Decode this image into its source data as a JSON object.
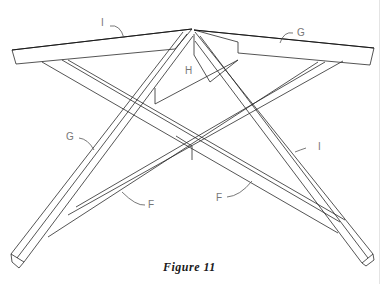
{
  "figure": {
    "caption": "Figure 11",
    "labels": [
      {
        "id": "I-top-left",
        "text": "I",
        "x": 101,
        "y": 26
      },
      {
        "id": "G-top-right",
        "text": "G",
        "x": 297,
        "y": 36
      },
      {
        "id": "H-center",
        "text": "H",
        "x": 185,
        "y": 74
      },
      {
        "id": "G-left",
        "text": "G",
        "x": 66,
        "y": 140
      },
      {
        "id": "I-right",
        "text": "I",
        "x": 318,
        "y": 146
      },
      {
        "id": "F-left",
        "text": "F",
        "x": 148,
        "y": 208
      },
      {
        "id": "F-right",
        "text": "F",
        "x": 218,
        "y": 201
      }
    ],
    "colors": {
      "line": "#2a2a2a",
      "label": "#777777",
      "background": "#ffffff"
    }
  }
}
